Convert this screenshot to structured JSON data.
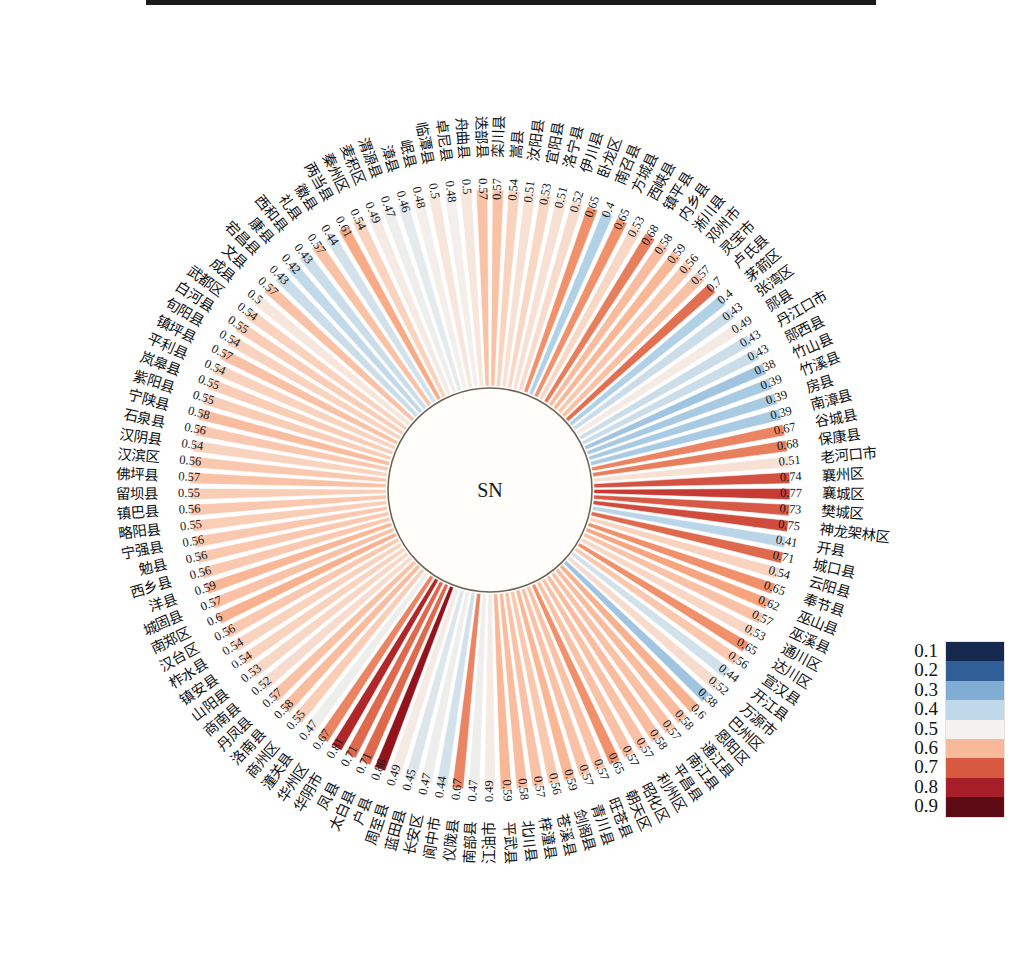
{
  "figure": {
    "center_label": "SN",
    "caption": ""
  },
  "legend": {
    "name": "colorbar",
    "position": "right",
    "labels": [
      "0.1",
      "0.2",
      "0.3",
      "0.4",
      "0.5",
      "0.6",
      "0.7",
      "0.8",
      "0.9"
    ],
    "colors": [
      "#15294e",
      "#2f5f96",
      "#7fadd4",
      "#bfd9ea",
      "#f4f1ee",
      "#f7b99a",
      "#d7593f",
      "#a61e28",
      "#5c0a14"
    ]
  },
  "chart_data": {
    "type": "bar",
    "subtype": "circular-radial-bar",
    "title": "",
    "subtitle": "",
    "xlabel": "",
    "ylabel": "",
    "center_label": "SN",
    "value_range": [
      0.1,
      0.9
    ],
    "colormap": "RdBu_r",
    "grid": false,
    "legend_position": "right",
    "start_angle_deg": -90,
    "direction": "clockwise",
    "categories": [
      "栾川县",
      "嵩县",
      "汝阳县",
      "宜阳县",
      "洛宁县",
      "伊川县",
      "卧龙区",
      "南召县",
      "方城县",
      "西峡县",
      "镇平县",
      "内乡县",
      "淅川县",
      "邓州市",
      "灵宝市",
      "卢氏县",
      "茅箭区",
      "张湾区",
      "郧县",
      "丹江口市",
      "郧西县",
      "竹山县",
      "竹溪县",
      "房县",
      "南漳县",
      "谷城县",
      "保康县",
      "老河口市",
      "襄州区",
      "襄城区",
      "樊城区",
      "神龙架林区",
      "开县",
      "城口县",
      "云阳县",
      "奉节县",
      "巫山县",
      "巫溪县",
      "通川区",
      "达川区",
      "宣汉县",
      "开江县",
      "万源市",
      "巴州区",
      "恩阳区",
      "通江县",
      "南江县",
      "平昌县",
      "利州区",
      "昭化区",
      "朝天区",
      "旺苍县",
      "青川县",
      "剑阁县",
      "苍溪县",
      "梓潼县",
      "北川县",
      "平武县",
      "江油市",
      "南部县",
      "仪陇县",
      "阆中市",
      "长安区",
      "蓝田县",
      "周至县",
      "户县",
      "太白县",
      "凤县",
      "华阴市",
      "华州区",
      "潼关县",
      "商州区",
      "洛南县",
      "丹凤县",
      "商南县",
      "山阳县",
      "镇安县",
      "柞水县",
      "汉台区",
      "南郑区",
      "城固县",
      "洋县",
      "西乡县",
      "勉县",
      "宁强县",
      "略阳县",
      "镇巴县",
      "留坝县",
      "佛坪县",
      "汉滨区",
      "汉阴县",
      "石泉县",
      "宁陕县",
      "紫阳县",
      "岚皋县",
      "平利县",
      "镇坪县",
      "旬阳县",
      "白河县",
      "武都区",
      "成县",
      "文县",
      "宕昌县",
      "康县",
      "西和县",
      "礼县",
      "徽县",
      "两当县",
      "秦州区",
      "麦积区",
      "渭源县",
      "漳县",
      "岷县",
      "临潭县",
      "卓尼县",
      "舟曲县",
      "迭部县"
    ],
    "values": [
      0.57,
      0.54,
      0.51,
      0.53,
      0.51,
      0.52,
      0.65,
      0.4,
      0.65,
      0.53,
      0.68,
      0.58,
      0.59,
      0.56,
      0.57,
      0.7,
      0.4,
      0.43,
      0.49,
      0.43,
      0.43,
      0.38,
      0.39,
      0.39,
      0.39,
      0.67,
      0.68,
      0.51,
      0.74,
      0.77,
      0.73,
      0.75,
      0.41,
      0.71,
      0.54,
      0.65,
      0.62,
      0.57,
      0.53,
      0.65,
      0.56,
      0.44,
      0.52,
      0.38,
      0.6,
      0.58,
      0.57,
      0.58,
      0.57,
      0.57,
      0.65,
      0.57,
      0.57,
      0.59,
      0.56,
      0.57,
      0.58,
      0.59,
      0.49,
      0.47,
      0.67,
      0.44,
      0.47,
      0.45,
      0.49,
      0.86,
      0.71,
      0.71,
      0.81,
      0.67,
      0.47,
      0.55,
      0.58,
      0.57,
      0.52,
      0.53,
      0.54,
      0.54,
      0.56,
      0.6,
      0.57,
      0.59,
      0.56,
      0.56,
      0.56,
      0.55,
      0.56,
      0.55,
      0.57,
      0.56,
      0.54,
      0.56,
      0.58,
      0.55,
      0.55,
      0.54,
      0.57,
      0.54,
      0.55,
      0.54,
      0.5,
      0.57,
      0.43,
      0.42,
      0.43,
      0.57,
      0.44,
      0.61,
      0.54,
      0.49,
      0.47,
      0.46,
      0.48,
      0.5,
      0.48,
      0.5,
      0.57
    ]
  }
}
